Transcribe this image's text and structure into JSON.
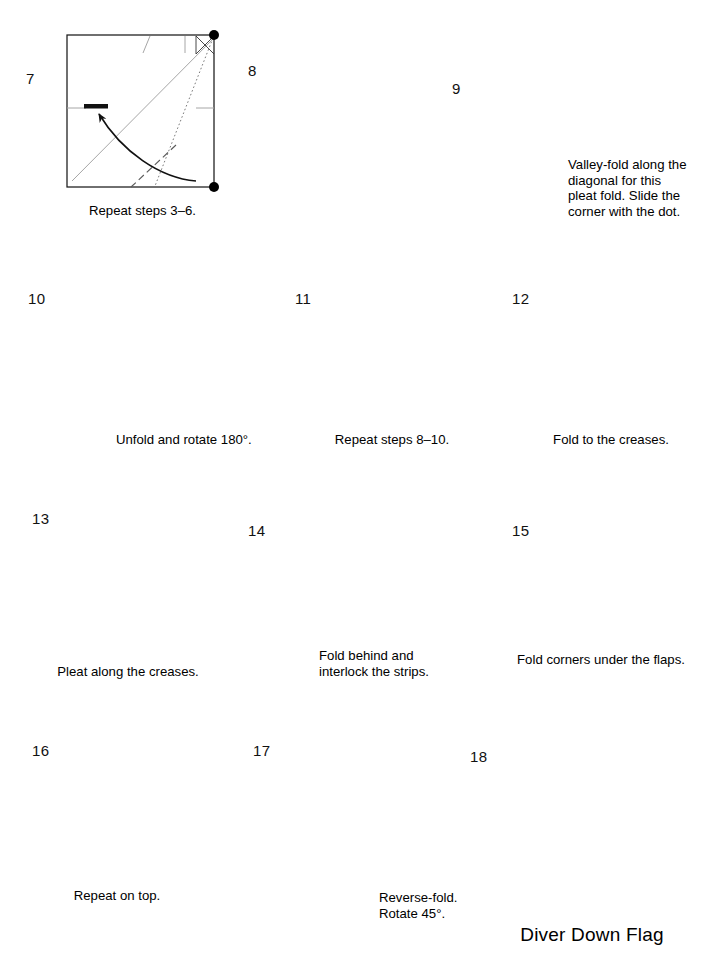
{
  "document": {
    "type": "origami-instruction-diagram",
    "model_title": "Diver Down Flag",
    "page_background": "#ffffff",
    "paper_front_color": "#808080",
    "paper_back_color": "#ffffff",
    "line_color": "#1a1a1a",
    "crease_color": "#9a9a9a"
  },
  "steps": [
    {
      "number": "7",
      "caption": "Repeat steps 3–6.",
      "shape": "square",
      "dots": 2
    },
    {
      "number": "8",
      "caption": "",
      "shape": "square",
      "dots": 2
    },
    {
      "number": "9",
      "caption": "Valley-fold along the\ndiagonal for this\npleat fold. Slide the\ncorner with the dot.",
      "shape": "triangle",
      "dots": 1
    },
    {
      "number": "10",
      "caption": "Unfold and rotate 180°.",
      "shape": "triangle",
      "dots": 0
    },
    {
      "number": "11",
      "caption": "Repeat steps 8–10.",
      "shape": "square",
      "dots": 2
    },
    {
      "number": "12",
      "caption": "Fold to the creases.",
      "shape": "square",
      "dots": 2
    },
    {
      "number": "13",
      "caption": "Pleat along the creases.",
      "shape": "parallelogram",
      "dots": 0
    },
    {
      "number": "14",
      "caption": "Fold behind and\ninterlock the strips.",
      "shape": "parallelogram-with-strip",
      "dots": 0
    },
    {
      "number": "15",
      "caption": "Fold corners under the flaps.",
      "shape": "flaps",
      "dots": 0
    },
    {
      "number": "16",
      "caption": "Repeat on top.",
      "shape": "flaps-folded",
      "dots": 0
    },
    {
      "number": "17",
      "caption": "Reverse-fold.\nRotate 45°.",
      "shape": "diamond",
      "dots": 0
    },
    {
      "number": "18",
      "caption": "",
      "shape": "finished-flag",
      "dots": 0
    }
  ],
  "icons": {
    "turn_over_1": "turn-over-icon",
    "turn_over_2": "turn-over-icon",
    "push_arrows": "push-in-arrow-icon"
  }
}
